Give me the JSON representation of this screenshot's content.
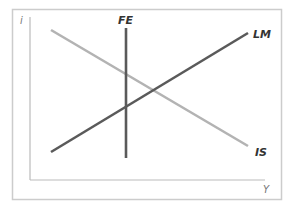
{
  "diagram": {
    "axes": {
      "y_label": "i",
      "x_label": "Y"
    },
    "curves": [
      {
        "name": "IS",
        "label": "IS",
        "color": "#b3b3b3",
        "slope": "downward"
      },
      {
        "name": "LM",
        "label": "LM",
        "color": "#5a5a5a",
        "slope": "upward"
      },
      {
        "name": "FE",
        "label": "FE",
        "color": "#5a5a5a",
        "slope": "vertical"
      }
    ],
    "frame_color": "#cccccc",
    "axis_color": "#bbbbbb"
  }
}
